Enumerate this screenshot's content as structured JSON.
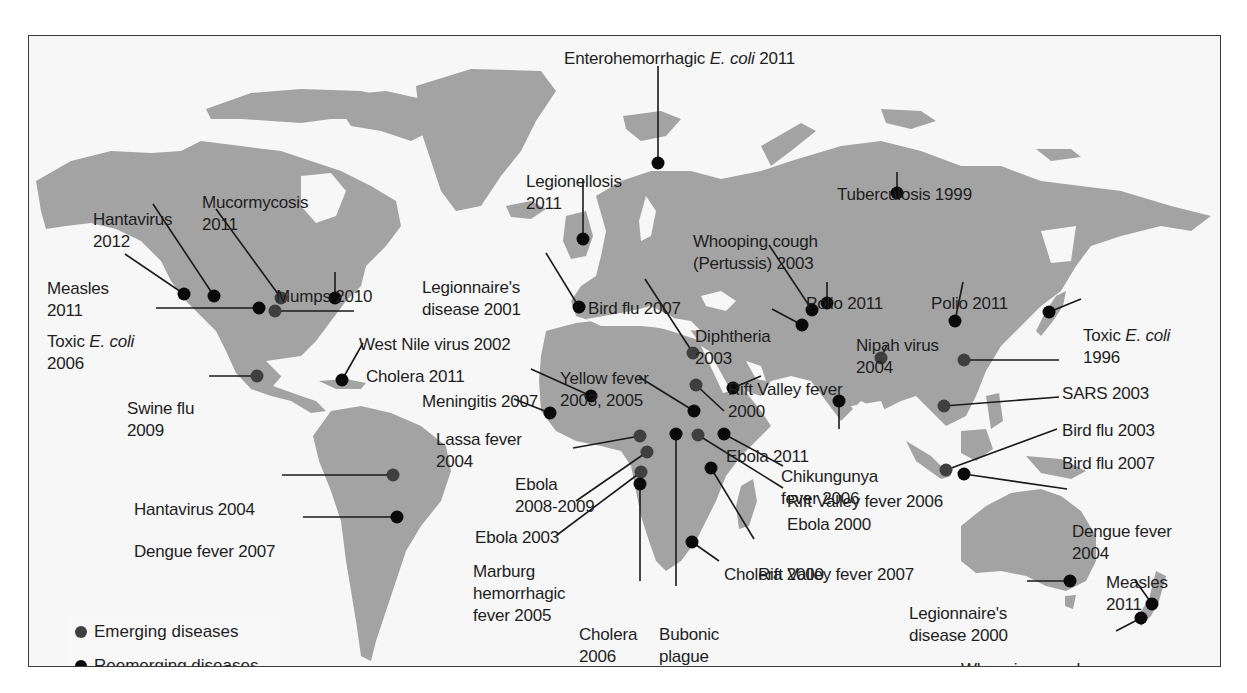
{
  "figure": {
    "type": "world-map",
    "colors": {
      "land": "#a3a3a3",
      "water": "#f7f7f7",
      "frame": "#3a3a3a",
      "emerging": "#3f3f3f",
      "reemerging": "#0a0a0a",
      "text": "#1e1e1e"
    }
  },
  "legend": {
    "items": [
      {
        "label": "Emerging diseases",
        "kind": "emerging"
      },
      {
        "label": "Reemerging diseases",
        "kind": "reemerging"
      }
    ]
  },
  "markers": [
    {
      "id": "enterohemorrhagic-ecoli-2011",
      "lines": [
        "Enterohemorrhagic |E. coli| 2011"
      ],
      "kind": "reemerging",
      "dot": [
        657,
        162
      ],
      "label": [
        563,
        12
      ],
      "leader": [
        [
          657,
          65
        ],
        [
          657,
          162
        ]
      ]
    },
    {
      "id": "legionellosis-2011",
      "lines": [
        "Legionellosis",
        "2011"
      ],
      "kind": "reemerging",
      "dot": [
        582,
        238
      ],
      "label": [
        525,
        135
      ],
      "leader": [
        [
          582,
          178
        ],
        [
          582,
          238
        ]
      ]
    },
    {
      "id": "tuberculosis-1999",
      "lines": [
        "Tuberculosis 1999"
      ],
      "kind": "reemerging",
      "dot": [
        896,
        192
      ],
      "label": [
        836,
        148
      ],
      "leader": [
        [
          896,
          171
        ],
        [
          896,
          192
        ]
      ]
    },
    {
      "id": "hantavirus-2012",
      "lines": [
        "Hantavirus",
        "2012"
      ],
      "kind": "reemerging",
      "dot": [
        213,
        295
      ],
      "label": [
        92,
        173
      ],
      "leader": [
        [
          152,
          203
        ],
        [
          213,
          295
        ]
      ]
    },
    {
      "id": "mucormycosis-2011",
      "lines": [
        "Mucormycosis",
        "2011"
      ],
      "kind": "emerging",
      "dot": [
        280,
        297
      ],
      "label": [
        201,
        156
      ],
      "leader": [
        [
          215,
          208
        ],
        [
          280,
          297
        ]
      ]
    },
    {
      "id": "measles-2011-na",
      "lines": [
        "Measles",
        "2011"
      ],
      "kind": "reemerging",
      "dot": [
        183,
        293
      ],
      "label": [
        46,
        242
      ],
      "leader": [
        [
          124,
          253
        ],
        [
          183,
          293
        ]
      ]
    },
    {
      "id": "mumps-2010",
      "lines": [
        "Mumps 2010"
      ],
      "kind": "reemerging",
      "dot": [
        334,
        297
      ],
      "label": [
        275,
        250
      ],
      "leader": [
        [
          334,
          271
        ],
        [
          334,
          297
        ]
      ]
    },
    {
      "id": "toxic-ecoli-2006",
      "lines": [
        "Toxic |E. coli|",
        "2006"
      ],
      "kind": "reemerging",
      "dot": [
        258,
        307
      ],
      "label": [
        46,
        295
      ],
      "leader": [
        [
          155,
          307
        ],
        [
          258,
          307
        ]
      ]
    },
    {
      "id": "west-nile-2002",
      "lines": [
        "West Nile virus 2002"
      ],
      "kind": "emerging",
      "dot": [
        274,
        310
      ],
      "label": [
        358,
        298
      ],
      "leader": [
        [
          274,
          310
        ],
        [
          353,
          310
        ]
      ]
    },
    {
      "id": "cholera-2011-haiti",
      "lines": [
        "Cholera 2011"
      ],
      "kind": "reemerging",
      "dot": [
        341,
        379
      ],
      "label": [
        365,
        330
      ],
      "leader": [
        [
          341,
          379
        ],
        [
          362,
          342
        ]
      ]
    },
    {
      "id": "swine-flu-2009",
      "lines": [
        "Swine flu",
        "2009"
      ],
      "kind": "emerging",
      "dot": [
        256,
        375
      ],
      "label": [
        126,
        362
      ],
      "leader": [
        [
          208,
          375
        ],
        [
          256,
          375
        ]
      ]
    },
    {
      "id": "hantavirus-2004",
      "lines": [
        "Hantavirus 2004"
      ],
      "kind": "emerging",
      "dot": [
        392,
        474
      ],
      "label": [
        133,
        463
      ],
      "leader": [
        [
          281,
          474
        ],
        [
          392,
          474
        ]
      ]
    },
    {
      "id": "dengue-fever-2007-sa",
      "lines": [
        "Dengue fever 2007"
      ],
      "kind": "reemerging",
      "dot": [
        396,
        516
      ],
      "label": [
        133,
        505
      ],
      "leader": [
        [
          302,
          516
        ],
        [
          396,
          516
        ]
      ]
    },
    {
      "id": "legionnaires-2001",
      "lines": [
        "Legionnaire's",
        "disease 2001"
      ],
      "kind": "reemerging",
      "dot": [
        578,
        306
      ],
      "label": [
        421,
        241
      ],
      "leader": [
        [
          545,
          252
        ],
        [
          578,
          306
        ]
      ]
    },
    {
      "id": "bird-flu-2007-egypt",
      "lines": [
        "Bird flu 2007"
      ],
      "kind": "emerging",
      "dot": [
        692,
        352
      ],
      "label": [
        587,
        262
      ],
      "leader": [
        [
          644,
          278
        ],
        [
          692,
          352
        ]
      ]
    },
    {
      "id": "whooping-cough-2003",
      "lines": [
        "Whooping cough",
        "(Pertussis) 2003"
      ],
      "kind": "reemerging",
      "dot": [
        811,
        309
      ],
      "label": [
        692,
        195
      ],
      "leader": [
        [
          768,
          244
        ],
        [
          811,
          309
        ]
      ]
    },
    {
      "id": "polio-2011-india",
      "lines": [
        "Polio 2011"
      ],
      "kind": "reemerging",
      "dot": [
        826,
        302
      ],
      "label": [
        805,
        257
      ],
      "leader": [
        [
          826,
          281
        ],
        [
          826,
          302
        ]
      ]
    },
    {
      "id": "diphtheria-2003",
      "lines": [
        "Diphtheria",
        "2003"
      ],
      "kind": "reemerging",
      "dot": [
        801,
        324
      ],
      "label": [
        694,
        290
      ],
      "leader": [
        [
          771,
          308
        ],
        [
          801,
          324
        ]
      ]
    },
    {
      "id": "polio-2011-china",
      "lines": [
        "Polio 2011"
      ],
      "kind": "reemerging",
      "dot": [
        954,
        320
      ],
      "label": [
        930,
        257
      ],
      "leader": [
        [
          962,
          281
        ],
        [
          954,
          320
        ]
      ]
    },
    {
      "id": "nipah-2004",
      "lines": [
        "Nipah virus",
        "2004"
      ],
      "kind": "emerging",
      "dot": [
        880,
        357
      ],
      "label": [
        855,
        299
      ],
      "leader": [
        [
          886,
          344
        ],
        [
          880,
          357
        ]
      ]
    },
    {
      "id": "toxic-ecoli-1996",
      "lines": [
        "Toxic |E. coli|",
        "1996"
      ],
      "kind": "reemerging",
      "dot": [
        1048,
        311
      ],
      "label": [
        1082,
        289
      ],
      "leader": [
        [
          1048,
          311
        ],
        [
          1080,
          298
        ]
      ]
    },
    {
      "id": "sars-2003",
      "lines": [
        "SARS 2003"
      ],
      "kind": "emerging",
      "dot": [
        963,
        359
      ],
      "label": [
        1061,
        347
      ],
      "leader": [
        [
          963,
          359
        ],
        [
          1058,
          359
        ]
      ]
    },
    {
      "id": "bird-flu-2003",
      "lines": [
        "Bird flu 2003"
      ],
      "kind": "emerging",
      "dot": [
        943,
        405
      ],
      "label": [
        1061,
        384
      ],
      "leader": [
        [
          943,
          405
        ],
        [
          1058,
          396
        ]
      ]
    },
    {
      "id": "bird-flu-2007-indonesia",
      "lines": [
        "Bird flu 2007"
      ],
      "kind": "emerging",
      "dot": [
        945,
        469
      ],
      "label": [
        1061,
        417
      ],
      "leader": [
        [
          945,
          469
        ],
        [
          1056,
          428
        ]
      ]
    },
    {
      "id": "dengue-fever-2004",
      "lines": [
        "Dengue fever",
        "2004"
      ],
      "kind": "reemerging",
      "dot": [
        963,
        473
      ],
      "label": [
        1071,
        485
      ],
      "leader": [
        [
          963,
          473
        ],
        [
          1066,
          488
        ]
      ]
    },
    {
      "id": "yellow-fever-2003-2005",
      "lines": [
        "Yellow fever",
        "2003, 2005"
      ],
      "kind": "reemerging",
      "dot": [
        693,
        410
      ],
      "label": [
        559,
        332
      ],
      "leader": [
        [
          638,
          376
        ],
        [
          693,
          410
        ]
      ]
    },
    {
      "id": "meningitis-2007",
      "lines": [
        "Meningitis 2007"
      ],
      "kind": "reemerging",
      "dot": [
        590,
        395
      ],
      "label": [
        421,
        355
      ],
      "leader": [
        [
          530,
          368
        ],
        [
          590,
          395
        ]
      ]
    },
    {
      "id": "lassa-fever-2004",
      "lines": [
        "Lassa fever",
        "2004"
      ],
      "kind": "reemerging",
      "dot": [
        549,
        412
      ],
      "label": [
        435,
        393
      ],
      "leader": [
        [
          513,
          398
        ],
        [
          549,
          412
        ]
      ]
    },
    {
      "id": "rift-valley-fever-2000",
      "lines": [
        "Rift Valley fever",
        "2000"
      ],
      "kind": "reemerging",
      "dot": [
        732,
        387
      ],
      "label": [
        727,
        343
      ],
      "leader": [
        [
          732,
          387
        ],
        [
          760,
          375
        ]
      ]
    },
    {
      "id": "ebola-2011",
      "lines": [
        "Ebola 2011"
      ],
      "kind": "emerging",
      "dot": [
        695,
        384
      ],
      "label": [
        725,
        410
      ],
      "leader": [
        [
          695,
          384
        ],
        [
          723,
          410
        ]
      ]
    },
    {
      "id": "chikungunya-2006",
      "lines": [
        "Chikungunya",
        "fever 2006"
      ],
      "kind": "reemerging",
      "dot": [
        838,
        400
      ],
      "label": [
        780,
        430
      ],
      "leader": [
        [
          838,
          400
        ],
        [
          838,
          428
        ]
      ]
    },
    {
      "id": "ebola-2008-2009",
      "lines": [
        "Ebola",
        "2008-2009"
      ],
      "kind": "emerging",
      "dot": [
        639,
        435
      ],
      "label": [
        514,
        438
      ],
      "leader": [
        [
          572,
          447
        ],
        [
          639,
          435
        ]
      ]
    },
    {
      "id": "bubonic-plague-2005",
      "lines": [
        "Bubonic",
        "plague",
        "2005"
      ],
      "kind": "reemerging",
      "dot": [
        675,
        433
      ],
      "label": [
        658,
        588
      ],
      "leader": [
        [
          675,
          433
        ],
        [
          675,
          585
        ]
      ]
    },
    {
      "id": "ebola-2000",
      "lines": [
        "Ebola 2000"
      ],
      "kind": "emerging",
      "dot": [
        697,
        434
      ],
      "label": [
        786,
        478
      ],
      "leader": [
        [
          697,
          434
        ],
        [
          782,
          487
        ]
      ]
    },
    {
      "id": "rift-valley-fever-2006",
      "lines": [
        "Rift Valley fever 2006"
      ],
      "kind": "reemerging",
      "dot": [
        723,
        433
      ],
      "label": [
        786,
        455
      ],
      "leader": [
        [
          723,
          433
        ],
        [
          782,
          465
        ]
      ]
    },
    {
      "id": "ebola-2003",
      "lines": [
        "Ebola 2003"
      ],
      "kind": "emerging",
      "dot": [
        646,
        451
      ],
      "label": [
        474,
        491
      ],
      "leader": [
        [
          575,
          500
        ],
        [
          646,
          451
        ]
      ]
    },
    {
      "id": "marburg-2005",
      "lines": [
        "Marburg",
        "hemorrhagic",
        "fever 2005"
      ],
      "kind": "emerging",
      "dot": [
        640,
        471
      ],
      "label": [
        472,
        525
      ],
      "leader": [
        [
          556,
          534
        ],
        [
          640,
          471
        ]
      ]
    },
    {
      "id": "cholera-2006",
      "lines": [
        "Cholera",
        "2006"
      ],
      "kind": "reemerging",
      "dot": [
        639,
        483
      ],
      "label": [
        578,
        588
      ],
      "leader": [
        [
          639,
          483
        ],
        [
          639,
          580
        ]
      ]
    },
    {
      "id": "rift-valley-fever-2007",
      "lines": [
        "Rift Valley fever 2007"
      ],
      "kind": "reemerging",
      "dot": [
        710,
        467
      ],
      "label": [
        757,
        528
      ],
      "leader": [
        [
          710,
          467
        ],
        [
          753,
          538
        ]
      ]
    },
    {
      "id": "cholera-2000",
      "lines": [
        "Cholera 2000"
      ],
      "kind": "reemerging",
      "dot": [
        691,
        541
      ],
      "label": [
        723,
        528
      ],
      "leader": [
        [
          691,
          541
        ],
        [
          718,
          560
        ]
      ]
    },
    {
      "id": "legionnaires-2000",
      "lines": [
        "Legionnaire's",
        "disease 2000"
      ],
      "kind": "reemerging",
      "dot": [
        1069,
        580
      ],
      "label": [
        908,
        567
      ],
      "leader": [
        [
          1026,
          580
        ],
        [
          1069,
          580
        ]
      ]
    },
    {
      "id": "measles-2011-nz",
      "lines": [
        "Measles",
        "2011"
      ],
      "kind": "reemerging",
      "dot": [
        1151,
        603
      ],
      "label": [
        1105,
        536
      ],
      "leader": [
        [
          1134,
          579
        ],
        [
          1151,
          603
        ]
      ]
    },
    {
      "id": "whooping-cough-2011",
      "lines": [
        "Whooping cough",
        "(Pertussis) 2011"
      ],
      "kind": "reemerging",
      "dot": [
        1140,
        617
      ],
      "label": [
        960,
        623
      ],
      "leader": [
        [
          1115,
          630
        ],
        [
          1140,
          617
        ]
      ]
    }
  ]
}
